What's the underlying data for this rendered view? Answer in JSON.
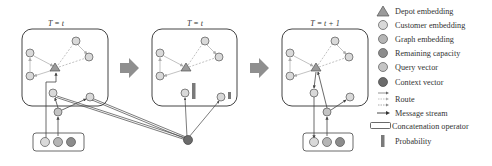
{
  "panels": [
    {
      "title": "T = t",
      "id": "panel-1"
    },
    {
      "title": "T = t",
      "id": "panel-2"
    },
    {
      "title": "T = t + 1",
      "id": "panel-3"
    }
  ],
  "legend": {
    "items": [
      {
        "symbol": "triangle",
        "label": "Depot embedding"
      },
      {
        "symbol": "circle-light",
        "label": "Customer embedding"
      },
      {
        "symbol": "circle-mid",
        "label": "Graph embedding"
      },
      {
        "symbol": "circle-dark",
        "label": "Remaining capacity"
      },
      {
        "symbol": "circle-query",
        "label": "Query vector"
      },
      {
        "symbol": "circle-context",
        "label": "Context vector"
      },
      {
        "symbol": "route-arrows",
        "label": "Route"
      },
      {
        "symbol": "message-arrow",
        "label": "Message stream"
      },
      {
        "symbol": "concat-box",
        "label": "Concatenation operator"
      },
      {
        "symbol": "probability-bar",
        "label": "Probability"
      }
    ]
  },
  "colors": {
    "customer": "#d9d9d9",
    "graph": "#b5b5b5",
    "capacity": "#8c8c8c",
    "query": "#c4c4c4",
    "context": "#6b6b6b",
    "depot": "#9a9a9a",
    "transition_arrow": "#8f8f8f",
    "probability_bar": "#7a7a7a",
    "route_dashed": "#bdbdbd",
    "stroke": "#555555"
  }
}
